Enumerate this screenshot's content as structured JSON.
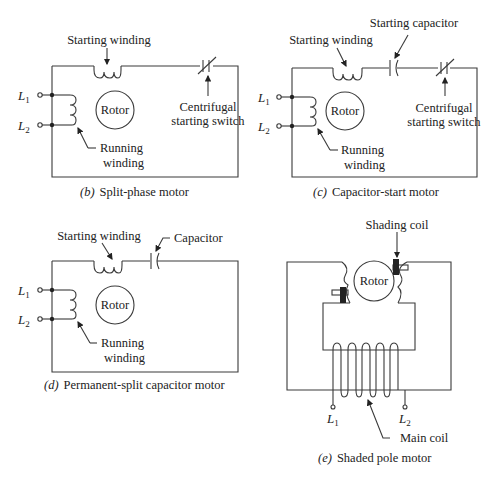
{
  "diagrams": {
    "b": {
      "caption_letter": "(b)",
      "caption": "Split-phase motor",
      "starting_winding": "Starting winding",
      "rotor": "Rotor",
      "switch_line1": "Centrifugal",
      "switch_line2": "starting switch",
      "running_line1": "Running",
      "running_line2": "winding",
      "l1": "L",
      "l1_sub": "1",
      "l2": "L",
      "l2_sub": "2"
    },
    "c": {
      "caption_letter": "(c)",
      "caption": "Capacitor-start motor",
      "starting_winding": "Starting winding",
      "starting_capacitor": "Starting capacitor",
      "rotor": "Rotor",
      "switch_line1": "Centrifugal",
      "switch_line2": "starting switch",
      "running_line1": "Running",
      "running_line2": "winding",
      "l1": "L",
      "l1_sub": "1",
      "l2": "L",
      "l2_sub": "2"
    },
    "d": {
      "caption_letter": "(d)",
      "caption": "Permanent-split capacitor motor",
      "starting_winding": "Starting winding",
      "capacitor": "Capacitor",
      "rotor": "Rotor",
      "running_line1": "Running",
      "running_line2": "winding",
      "l1": "L",
      "l1_sub": "1",
      "l2": "L",
      "l2_sub": "2"
    },
    "e": {
      "caption_letter": "(e)",
      "caption": "Shaded pole motor",
      "shading_coil": "Shading coil",
      "rotor": "Rotor",
      "main_coil": "Main coil",
      "l1": "L",
      "l1_sub": "1",
      "l2": "L",
      "l2_sub": "2"
    }
  }
}
